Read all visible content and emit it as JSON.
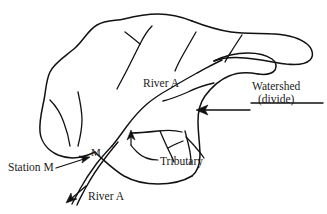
{
  "figure": {
    "type": "hand-drawn schematic map",
    "background_color": "#ffffff",
    "ink_color": "#111111"
  },
  "labels": {
    "river_main": "River A",
    "watershed_line1": "Watershed",
    "watershed_line2": "(divide)",
    "tributary": "Tributary",
    "station": "Station M",
    "station_point": "M",
    "river_outlet": "River A"
  },
  "annotations": [
    {
      "name": "watershed-divide",
      "text": "Watershed (divide)",
      "pointer": "arrow-left",
      "target": "basin-boundary-right"
    },
    {
      "name": "tributary",
      "text": "Tributary",
      "pointer": "arrow-up",
      "target": "tributary-confluence"
    },
    {
      "name": "station-m",
      "text": "Station M",
      "pointer": "arrow-up-right",
      "target": "gauging-point-M"
    },
    {
      "name": "river-outlet",
      "text": "River A",
      "pointer": "arrow-down-left",
      "target": "basin-outlet-channel"
    }
  ],
  "features": {
    "basin_outline": "closed irregular watershed boundary with narrow eastern lobe",
    "main_channel": "River A flowing from upper right of basin southwest to outlet past Station M",
    "tributaries_count": 9,
    "outlet_style": "double-line channel exiting basin at lower left"
  },
  "icons": {
    "arrow_left": "arrow-left-icon",
    "arrow_up": "arrow-up-icon",
    "arrow_up_right": "arrow-up-right-icon",
    "arrow_down_left": "arrow-down-left-icon"
  }
}
